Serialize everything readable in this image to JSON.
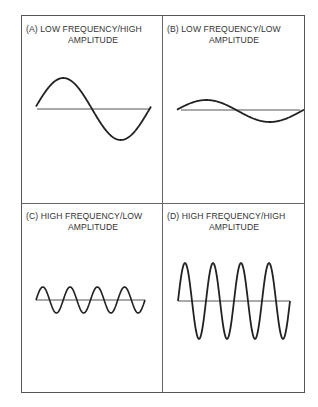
{
  "panels": [
    {
      "id": "A",
      "title_line1": "(A) LOW FREQUENCY/HIGH",
      "title_line2": "AMPLITUDE",
      "frequency": "low",
      "amplitude": "high",
      "cycles": 1
    },
    {
      "id": "B",
      "title_line1": "(B) LOW FREQUENCY/LOW",
      "title_line2": "AMPLITUDE",
      "frequency": "low",
      "amplitude": "low",
      "cycles": 1
    },
    {
      "id": "C",
      "title_line1": "(C) HIGH FREQUENCY/LOW",
      "title_line2": "AMPLITUDE",
      "frequency": "high",
      "amplitude": "low",
      "cycles": 4
    },
    {
      "id": "D",
      "title_line1": "(D) HIGH FREQUENCY/HIGH",
      "title_line2": "AMPLITUDE",
      "frequency": "high",
      "amplitude": "high",
      "cycles": 4
    }
  ],
  "colors": {
    "wave": "#222222",
    "baseline": "#555555",
    "border": "#555555"
  }
}
